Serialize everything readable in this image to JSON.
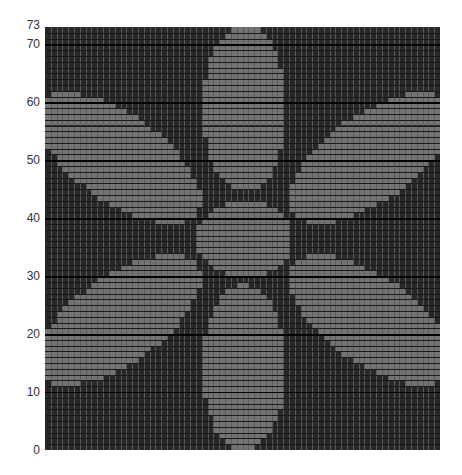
{
  "chart_data": {
    "type": "heatmap",
    "title": "",
    "grid": {
      "columns": 68,
      "rows": 73
    },
    "colors": {
      "background": "#282828",
      "fill": "#737373",
      "vline": "#5a5a5a",
      "hline": "#1a1a1a",
      "major_hline": "#000000"
    },
    "ylabel": "",
    "xlabel": "",
    "y_ticks": [
      0,
      10,
      20,
      30,
      40,
      50,
      60,
      70,
      73
    ],
    "ylim": [
      0,
      73
    ],
    "shapes": [
      {
        "name": "top-petal",
        "type": "ellipse",
        "cx": 34.2,
        "cy": 59.0,
        "rx": 7.2,
        "ry": 14.5,
        "angle": 0
      },
      {
        "name": "bottom-petal",
        "type": "ellipse",
        "cx": 34.2,
        "cy": 14.3,
        "rx": 7.2,
        "ry": 14.3,
        "angle": 0
      },
      {
        "name": "center",
        "type": "ellipse",
        "cx": 34.2,
        "cy": 36.5,
        "rx": 8.2,
        "ry": 6.6,
        "angle": 0
      },
      {
        "name": "upper-left-petal",
        "type": "ellipse",
        "cx": 12.5,
        "cy": 50.5,
        "rx": 16.5,
        "ry": 7.5,
        "angle": -35
      },
      {
        "name": "upper-right-petal",
        "type": "ellipse",
        "cx": 56.0,
        "cy": 50.5,
        "rx": 16.5,
        "ry": 7.5,
        "angle": 35
      },
      {
        "name": "lower-left-petal",
        "type": "ellipse",
        "cx": 12.5,
        "cy": 22.5,
        "rx": 16.5,
        "ry": 7.5,
        "angle": 35
      },
      {
        "name": "lower-right-petal",
        "type": "ellipse",
        "cx": 56.0,
        "cy": 22.5,
        "rx": 16.5,
        "ry": 7.5,
        "angle": -35
      }
    ]
  },
  "axis": {
    "labels": [
      {
        "text": "73",
        "row": 73
      },
      {
        "text": "70",
        "row": 70
      },
      {
        "text": "60",
        "row": 60
      },
      {
        "text": "50",
        "row": 50
      },
      {
        "text": "40",
        "row": 40
      },
      {
        "text": "30",
        "row": 30
      },
      {
        "text": "20",
        "row": 20
      },
      {
        "text": "10",
        "row": 10
      },
      {
        "text": "0",
        "row": 0
      }
    ]
  }
}
